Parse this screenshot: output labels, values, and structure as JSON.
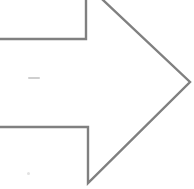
{
  "canvas": {
    "width": 194,
    "height": 189,
    "background_color": "#ffffff",
    "description": "Hand-drawn style right-pointing arrow outline, cropped at left and top edges"
  },
  "arrow": {
    "label": "right-arrow-outline",
    "direction": "right",
    "fill": "none",
    "stroke_color": "#808080",
    "stroke_width": 2.4,
    "stroke_linejoin": "miter",
    "tip_point": {
      "x": 188,
      "y": 82
    },
    "shaft": {
      "top_edge_y": 39,
      "bottom_edge_y": 127,
      "notch_x": 86,
      "left_edge_cropped": true
    },
    "head": {
      "top_vertex": {
        "x": 82,
        "y": -14
      },
      "bottom_vertex": {
        "x": 88,
        "y": 182
      },
      "top_vertex_cropped": true
    },
    "path": "M -12,39 L 86,39 L 86,-16 L 190,82 L 88,183 L 88,127 L -12,127 Z"
  },
  "marks": [
    {
      "id": "smudge-mid",
      "label": "faint-horizontal-smudge",
      "x": 28,
      "y": 77,
      "width": 12,
      "height": 2,
      "color": "#cfcfcf"
    },
    {
      "id": "smudge-low",
      "label": "faint-dot-smudge",
      "x": 27,
      "y": 172,
      "width": 3,
      "height": 3,
      "color": "#e2e2e2"
    }
  ]
}
